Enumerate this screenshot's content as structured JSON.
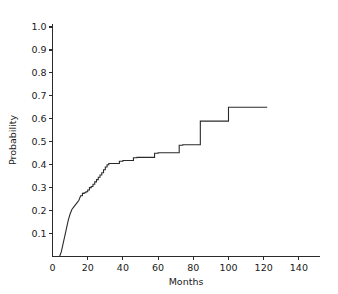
{
  "chart_data": {
    "type": "line",
    "subtype": "step",
    "title": "",
    "subtitle": "",
    "xlabel": "Months",
    "ylabel": "Probability",
    "xlim": [
      0,
      152
    ],
    "ylim": [
      0,
      1.0
    ],
    "xticks": [
      0,
      20,
      40,
      60,
      80,
      100,
      120,
      140
    ],
    "xtick_labels": [
      "0",
      "20",
      "40",
      "60",
      "80",
      "100",
      "120",
      "140"
    ],
    "yticks": [
      0.1,
      0.2,
      0.3,
      0.4,
      0.5,
      0.6,
      0.7,
      0.8,
      0.9,
      1.0
    ],
    "ytick_labels": [
      "0.1",
      "0.2",
      "0.3",
      "0.4",
      "0.5",
      "0.6",
      "0.7",
      "0.8",
      "0.9",
      "1.0"
    ],
    "grid": false,
    "legend": null,
    "legend_position": "none",
    "line_color": "#2b2b2b",
    "background_color": "#ffffff",
    "annotations": [],
    "series": [
      {
        "name": "Cumulative probability",
        "step_mode": "post",
        "x": [
          4,
          5,
          6,
          7,
          8,
          9,
          10,
          11,
          12,
          13,
          14,
          15,
          16,
          17,
          18,
          19,
          20,
          21,
          22,
          23,
          24,
          25,
          26,
          27,
          28,
          29,
          30,
          31,
          32,
          36,
          38,
          40,
          44,
          46,
          48,
          52,
          56,
          58,
          60,
          62,
          64,
          72,
          74,
          83,
          84,
          100,
          122
        ],
        "y": [
          0.0,
          0.02,
          0.055,
          0.09,
          0.125,
          0.16,
          0.185,
          0.205,
          0.215,
          0.225,
          0.235,
          0.245,
          0.265,
          0.275,
          0.278,
          0.282,
          0.29,
          0.3,
          0.305,
          0.315,
          0.325,
          0.335,
          0.345,
          0.355,
          0.365,
          0.378,
          0.39,
          0.4,
          0.405,
          0.405,
          0.415,
          0.418,
          0.418,
          0.43,
          0.432,
          0.432,
          0.432,
          0.45,
          0.452,
          0.452,
          0.452,
          0.485,
          0.487,
          0.487,
          0.59,
          0.65,
          0.65
        ]
      }
    ]
  },
  "axes": {
    "y_title": "Probability",
    "x_title": "Months"
  }
}
